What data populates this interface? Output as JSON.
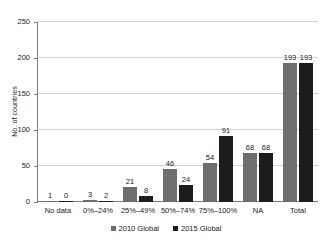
{
  "chart_data": {
    "type": "bar",
    "title": "",
    "subtitle": "",
    "xlabel": "",
    "ylabel": "No. of countries",
    "ylim": [
      0,
      250
    ],
    "yticks": [
      0,
      50,
      100,
      150,
      200,
      250
    ],
    "grid": true,
    "legend_position": "bottom-center",
    "categories": [
      "No data",
      "0%–24%",
      "25%–49%",
      "50%–74%",
      "75%–100%",
      "NA",
      "Total"
    ],
    "series": [
      {
        "name": "2010 Global",
        "color": "#6e6e6e",
        "values": [
          1,
          3,
          21,
          46,
          54,
          68,
          193
        ]
      },
      {
        "name": "2015 Global",
        "color": "#1c1c1c",
        "values": [
          0,
          2,
          8,
          24,
          91,
          68,
          193
        ]
      }
    ]
  },
  "axis": {
    "y_title": "No. of countries",
    "y_tick_labels": [
      "0",
      "50",
      "100",
      "150",
      "200",
      "250"
    ]
  },
  "legend": {
    "items": [
      {
        "label": "2010 Global",
        "color": "#6e6e6e"
      },
      {
        "label": "2015 Global",
        "color": "#1c1c1c"
      }
    ]
  }
}
